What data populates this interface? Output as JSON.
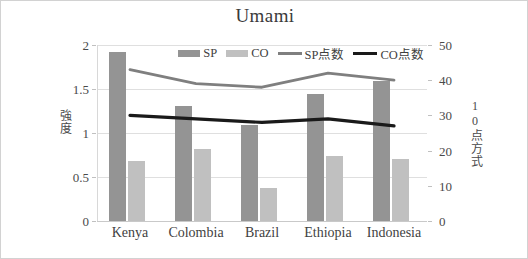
{
  "chart_data": {
    "type": "bar",
    "title": "Umami",
    "categories": [
      "Kenya",
      "Colombia",
      "Brazil",
      "Ethiopia",
      "Indonesia"
    ],
    "series": [
      {
        "name": "SP",
        "kind": "bar",
        "axis": "left",
        "color": "#949494",
        "values": [
          1.92,
          1.31,
          1.09,
          1.44,
          1.59
        ]
      },
      {
        "name": "CO",
        "kind": "bar",
        "axis": "left",
        "color": "#c0c0c0",
        "values": [
          0.68,
          0.82,
          0.37,
          0.74,
          0.7
        ]
      },
      {
        "name": "SP点数",
        "kind": "line",
        "axis": "right",
        "color": "#7f7f7f",
        "values": [
          43,
          39,
          38,
          42,
          40
        ]
      },
      {
        "name": "CO点数",
        "kind": "line",
        "axis": "right",
        "color": "#1a1a1a",
        "values": [
          30,
          29,
          28,
          29,
          27
        ]
      }
    ],
    "xlabel": "",
    "ylabel": "強度",
    "ylabel_right": "10点方式",
    "ylim": [
      0,
      2
    ],
    "ylim_right": [
      0,
      50
    ],
    "yticks": [
      "0",
      "0.5",
      "1",
      "1.5",
      "2"
    ],
    "yticks_right": [
      "0",
      "10",
      "20",
      "30",
      "40",
      "50"
    ],
    "grid": true,
    "legend_position": "top-center"
  },
  "legend": {
    "items": [
      {
        "label": "SP",
        "type": "bar",
        "color": "#949494"
      },
      {
        "label": "CO",
        "type": "bar",
        "color": "#c0c0c0"
      },
      {
        "label": "SP点数",
        "type": "line",
        "color": "#7f7f7f"
      },
      {
        "label": "CO点数",
        "type": "line",
        "color": "#1a1a1a"
      }
    ]
  }
}
